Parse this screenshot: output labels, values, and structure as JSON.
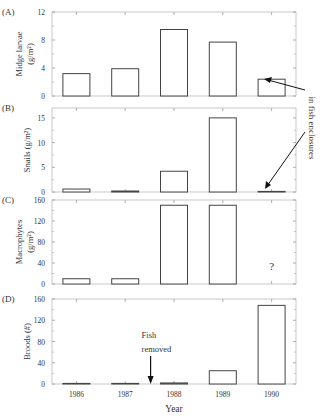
{
  "chart_data": [
    {
      "panel": "(A)",
      "type": "bar",
      "categories": [
        "1986",
        "1987",
        "1988",
        "1989",
        "1990"
      ],
      "values": [
        3.2,
        3.9,
        9.5,
        7.7,
        2.4
      ],
      "ylabel": "Midge larvae (g/m²)",
      "ylabel_line1": "Midge larvae",
      "ylabel_line2": "(g/m²)",
      "ylim": [
        0,
        12
      ],
      "yticks": [
        "0",
        "4",
        "8",
        "12"
      ]
    },
    {
      "panel": "(B)",
      "type": "bar",
      "categories": [
        "1986",
        "1987",
        "1988",
        "1989",
        "1990"
      ],
      "values": [
        0.6,
        0.2,
        4.2,
        15.0,
        0.1
      ],
      "ylabel": "Snails (g/m²)",
      "ylim": [
        0,
        17
      ],
      "yticks": [
        "0",
        "5",
        "10",
        "15"
      ]
    },
    {
      "panel": "(C)",
      "type": "bar",
      "categories": [
        "1986",
        "1987",
        "1988",
        "1989",
        "1990"
      ],
      "values": [
        10,
        10,
        150,
        150,
        null
      ],
      "ylabel": "Macrophytes (g/m²)",
      "ylabel_line1": "Macrophytes",
      "ylabel_line2": "(g/m²)",
      "ylim": [
        0,
        160
      ],
      "yticks": [
        "0",
        "40",
        "80",
        "120",
        "160"
      ],
      "annotation": "?"
    },
    {
      "panel": "(D)",
      "type": "bar",
      "categories": [
        "1986",
        "1987",
        "1988",
        "1989",
        "1990"
      ],
      "values": [
        0,
        1,
        2,
        25,
        148
      ],
      "ylabel": "Broods (#)",
      "ylim": [
        0,
        160
      ],
      "yticks": [
        "0",
        "40",
        "80",
        "120",
        "160"
      ],
      "annotation_line1": "Fish",
      "annotation_line2": "removed"
    }
  ],
  "xlabel": "Year",
  "side_annotation": "in fish enclosures"
}
